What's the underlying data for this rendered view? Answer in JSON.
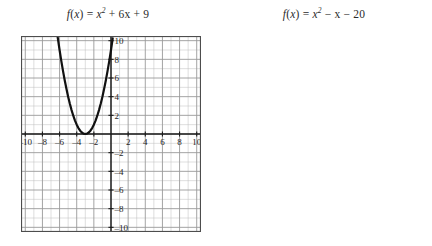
{
  "figure": {
    "background_color": "#ffffff",
    "grid_color": "#9a9a9a",
    "grid_minor_color": "#bdbdbd",
    "axis_color": "#1a1a1a",
    "curve_color": "#111111",
    "frame_color": "#4d4d4d"
  },
  "panels": [
    {
      "id": "left",
      "title_plain": "f(x) = x^2 + 6x + 9",
      "title_parts": {
        "fn": "f",
        "open": "(",
        "arg": "x",
        "close": ")",
        "equals": "=",
        "term1_base": "x",
        "term1_exp": "2",
        "rest": "+ 6x + 9"
      }
    },
    {
      "id": "right",
      "title_plain": "f(x) = x^2 − x − 20",
      "title_parts": {
        "fn": "f",
        "open": "(",
        "arg": "x",
        "close": ")",
        "equals": "=",
        "term1_base": "x",
        "term1_exp": "2",
        "rest": "− x − 20"
      }
    }
  ],
  "chart_data": [
    {
      "id": "left-graph",
      "type": "line",
      "title": "f(x) = x² + 6x + 9",
      "xlabel": "",
      "ylabel": "",
      "function": "x^2 + 6x + 9",
      "vertex": [
        -3,
        0
      ],
      "roots": [
        -3
      ],
      "y_intercept": 9,
      "grid": true,
      "grid_step_x": 1,
      "grid_step_y": 1,
      "legend": "none",
      "xlim": [
        -10.5,
        10.5
      ],
      "ylim": [
        -10.5,
        10.5
      ],
      "xticks": [
        -10,
        -8,
        -6,
        -4,
        -2,
        2,
        4,
        6,
        8,
        10
      ],
      "yticks": [
        10,
        8,
        6,
        4,
        2,
        -2,
        -4,
        -6,
        -8,
        -10
      ],
      "xtick_labels": [
        "–10",
        "–8",
        "–6",
        "–4",
        "–2",
        "2",
        "4",
        "6",
        "8",
        "10"
      ],
      "ytick_labels": [
        "10",
        "8",
        "6",
        "4",
        "2",
        "–2",
        "–4",
        "–6",
        "–8",
        "–10"
      ],
      "series": [
        {
          "name": "f(x) = x² + 6x + 9",
          "x": [
            -6.6,
            -6.4,
            -6.2,
            -6.0,
            -5.8,
            -5.6,
            -5.4,
            -5.2,
            -5.0,
            -4.8,
            -4.6,
            -4.4,
            -4.2,
            -4.0,
            -3.8,
            -3.6,
            -3.4,
            -3.2,
            -3.0,
            -2.8,
            -2.6,
            -2.4,
            -2.2,
            -2.0,
            -1.8,
            -1.6,
            -1.4,
            -1.2,
            -1.0,
            -0.8,
            -0.6,
            -0.4,
            -0.2,
            0.0,
            0.2
          ],
          "y": [
            12.96,
            11.56,
            10.24,
            9.0,
            7.84,
            6.76,
            5.76,
            4.84,
            4.0,
            3.24,
            2.56,
            1.96,
            1.44,
            1.0,
            0.64,
            0.36,
            0.16,
            0.04,
            0.0,
            0.04,
            0.16,
            0.36,
            0.64,
            1.0,
            1.44,
            1.96,
            2.56,
            3.24,
            4.0,
            4.84,
            5.76,
            6.76,
            7.84,
            9.0,
            10.24
          ]
        }
      ]
    },
    {
      "id": "right-graph",
      "type": "line",
      "title": "f(x) = x² − x − 20",
      "xlabel": "",
      "ylabel": "",
      "function": "x^2 - x - 20",
      "vertex": [
        0.5,
        -20.25
      ],
      "roots": [
        -4,
        5
      ],
      "y_intercept": -20,
      "grid": true,
      "grid_step_x": 1,
      "grid_step_y": 1.5,
      "legend": "none",
      "xlim": [
        -16.5,
        16.5
      ],
      "ylim": [
        -25.5,
        5.5
      ],
      "xticks": [
        -15,
        -12,
        -9,
        -6,
        -3,
        3,
        6,
        9,
        12,
        15
      ],
      "yticks": [
        3,
        -3,
        -6,
        -9,
        -12,
        -15,
        -18,
        -21,
        -24
      ],
      "xtick_labels": [
        "–15",
        "–12",
        "–9",
        "–6",
        "–3",
        "3",
        "6",
        "9",
        "12",
        "15"
      ],
      "ytick_labels": [
        "3",
        "–3",
        "–6",
        "–9",
        "–12",
        "–15",
        "–18",
        "–21",
        "–24"
      ],
      "series": [
        {
          "name": "f(x) = x² − x − 20",
          "x": [
            -4.7,
            -4.5,
            -4.3,
            -4.1,
            -3.9,
            -3.7,
            -3.5,
            -3.3,
            -3.1,
            -2.9,
            -2.7,
            -2.5,
            -2.3,
            -2.1,
            -1.9,
            -1.7,
            -1.5,
            -1.3,
            -1.1,
            -0.9,
            -0.7,
            -0.5,
            -0.3,
            -0.1,
            0.1,
            0.3,
            0.5,
            0.7,
            0.9,
            1.1,
            1.3,
            1.5,
            1.7,
            1.9,
            2.1,
            2.3,
            2.5,
            2.7,
            2.9,
            3.1,
            3.3,
            3.5,
            3.7,
            3.9,
            4.1,
            4.3,
            4.5,
            4.7,
            4.9,
            5.1,
            5.3,
            5.5,
            5.7
          ],
          "y": [
            6.79,
            4.75,
            2.79,
            0.91,
            -0.89,
            -2.61,
            -4.25,
            -5.81,
            -7.29,
            -8.69,
            -10.01,
            -11.25,
            -12.41,
            -13.49,
            -14.49,
            -15.41,
            -16.25,
            -17.01,
            -17.69,
            -18.29,
            -18.81,
            -19.25,
            -19.61,
            -19.89,
            -19.99,
            -19.21,
            -20.25,
            -20.81,
            -20.09,
            -20.89,
            -19.61,
            -19.25,
            -18.81,
            -18.29,
            -17.69,
            -17.01,
            -16.25,
            -15.41,
            -14.49,
            -13.49,
            -12.41,
            -11.25,
            -10.01,
            -8.69,
            -7.29,
            -5.81,
            -4.25,
            -2.61,
            -0.89,
            0.91,
            2.79,
            4.75,
            6.79
          ]
        }
      ]
    }
  ]
}
